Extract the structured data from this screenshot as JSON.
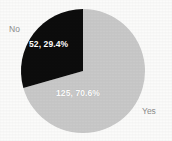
{
  "chart_data": {
    "type": "pie",
    "title": "",
    "categories": [
      "Yes",
      "No"
    ],
    "values": [
      125,
      52
    ],
    "percentages": [
      70.6,
      29.4
    ],
    "total": 177,
    "legend": "none",
    "slices": [
      {
        "name": "Yes",
        "count": 125,
        "percent": 70.6,
        "data_label": "125, 70.6%",
        "category_label": "Yes",
        "color": "#c9c9c9",
        "label_color": "#ffffff",
        "start_angle_deg": 0,
        "sweep_deg": 254.2,
        "direction": "clockwise"
      },
      {
        "name": "No",
        "count": 52,
        "percent": 29.4,
        "data_label": "52, 29.4%",
        "category_label": "No",
        "color": "#0d0d0d",
        "label_color": "#ffffff",
        "start_angle_deg": 254.2,
        "sweep_deg": 105.8,
        "direction": "clockwise"
      }
    ],
    "geometry": {
      "center_x": 83,
      "center_y": 71,
      "radius": 62
    },
    "colors": {
      "background": "#fbfbfa",
      "slice_yes": "#c9c9c9",
      "slice_no": "#0d0d0d",
      "category_text": "#8d8d8d",
      "data_label_text": "#ffffff"
    }
  }
}
